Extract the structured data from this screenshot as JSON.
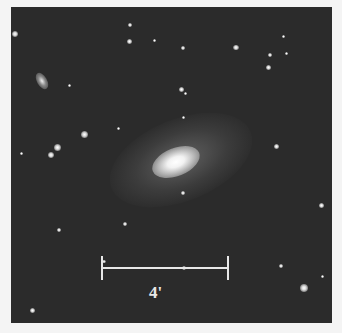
{
  "image": {
    "subject": "galaxy field",
    "scale_bar": {
      "label": "4'"
    },
    "colors": {
      "border": "#f4f4f4",
      "sky": "#2b2b2b",
      "scale_bar": "#e8e8e8"
    }
  }
}
